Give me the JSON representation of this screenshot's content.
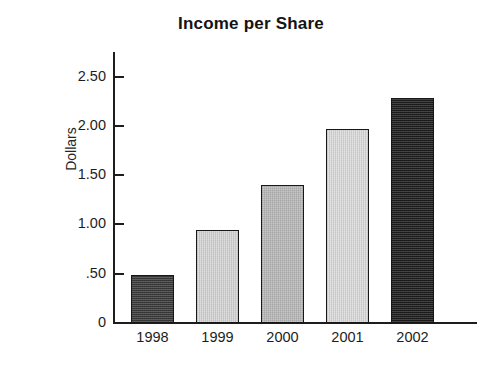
{
  "chart_data": {
    "type": "bar",
    "title": "Income per Share",
    "xlabel": "",
    "ylabel": "Dollars",
    "categories": [
      "1998",
      "1999",
      "2000",
      "2001",
      "2002"
    ],
    "values": [
      0.49,
      0.94,
      1.4,
      1.97,
      2.28
    ],
    "ylim": [
      0,
      2.75
    ],
    "ytick_values": [
      2.5,
      2.0,
      1.5,
      1.0,
      0.5,
      0
    ],
    "ytick_labels": [
      "2.50",
      "2.00",
      "1.50",
      "1.00",
      ".50",
      "0"
    ],
    "grid": false,
    "legend": "none",
    "bar_colors": [
      "#3a3a3a",
      "#d6d6d6",
      "#b9b9b9",
      "#dcdcdc",
      "#1c1c1c"
    ],
    "bar_border_color": "#171717",
    "axis_color": "#1d1d1d",
    "background_color": "#ffffff",
    "bars": [
      {
        "category": "1998",
        "value": 0.49,
        "label": "1998",
        "color": "#3a3a3a"
      },
      {
        "category": "1999",
        "value": 0.94,
        "label": "1999",
        "color": "#d6d6d6"
      },
      {
        "category": "2000",
        "value": 1.4,
        "label": "2000",
        "color": "#b9b9b9"
      },
      {
        "category": "2001",
        "value": 1.97,
        "label": "2001",
        "color": "#dcdcdc"
      },
      {
        "category": "2002",
        "value": 2.28,
        "label": "2002",
        "color": "#1c1c1c"
      }
    ]
  }
}
